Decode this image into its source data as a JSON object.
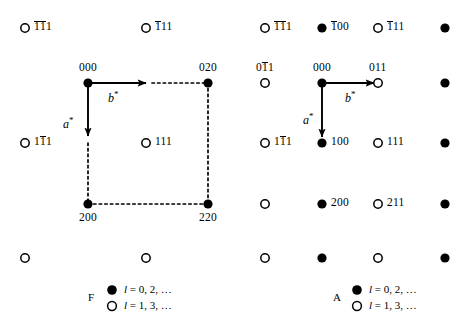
{
  "figure": {
    "type": "reciprocal-lattice-diagram",
    "geometry": {
      "width": 472,
      "height": 329,
      "row_y": [
        28,
        83,
        143,
        204,
        258
      ],
      "left_cols_x": [
        25,
        88,
        146,
        208
      ],
      "right_cols_x": [
        265,
        322,
        378,
        445
      ],
      "node_radius_filled": 4.6,
      "node_radius_open": 4.2
    }
  },
  "left_panel": {
    "id": "F",
    "cell": {
      "corners": [
        "000",
        "020",
        "220",
        "200"
      ],
      "origin_xy": [
        88,
        83
      ],
      "b_end_xy": [
        208,
        83
      ],
      "a_end_xy": [
        88,
        204
      ],
      "dashed": true
    },
    "vectors": {
      "a_label": "a",
      "a_star": "*",
      "b_label": "b",
      "b_star": "*"
    },
    "nodes": [
      {
        "x": 25,
        "y": 28,
        "fill": "open",
        "label": "1̅1̅1",
        "pos": "right"
      },
      {
        "x": 146,
        "y": 28,
        "fill": "open",
        "label": "1̅11",
        "pos": "right"
      },
      {
        "x": 88,
        "y": 83,
        "fill": "filled",
        "label": "000",
        "pos": "above"
      },
      {
        "x": 208,
        "y": 83,
        "fill": "filled",
        "label": "020",
        "pos": "above"
      },
      {
        "x": 25,
        "y": 143,
        "fill": "open",
        "label": "11̅1",
        "pos": "right"
      },
      {
        "x": 146,
        "y": 143,
        "fill": "open",
        "label": "111",
        "pos": "right"
      },
      {
        "x": 88,
        "y": 204,
        "fill": "filled",
        "label": "200",
        "pos": "below"
      },
      {
        "x": 208,
        "y": 204,
        "fill": "filled",
        "label": "220",
        "pos": "below"
      },
      {
        "x": 25,
        "y": 258,
        "fill": "open",
        "label": "",
        "pos": "none"
      },
      {
        "x": 146,
        "y": 258,
        "fill": "open",
        "label": "",
        "pos": "none"
      }
    ],
    "legend": {
      "panel_label": "F",
      "filled_text": "l = 0, 2, …",
      "open_text": "l = 1, 3, …",
      "filled_var": "l",
      "filled_rest": " = 0, 2, …",
      "open_var": "l",
      "open_rest": " = 1, 3, …"
    }
  },
  "right_panel": {
    "id": "A",
    "vectors": {
      "a_label": "a",
      "a_star": "*",
      "b_label": "b",
      "b_star": "*"
    },
    "origin_xy": [
      322,
      83
    ],
    "b_end_xy": [
      378,
      83
    ],
    "a_end_xy": [
      322,
      143
    ],
    "nodes": [
      {
        "x": 265,
        "y": 28,
        "fill": "open",
        "label": "1̅1̅1",
        "pos": "right"
      },
      {
        "x": 322,
        "y": 28,
        "fill": "filled",
        "label": "1̅00",
        "pos": "right"
      },
      {
        "x": 378,
        "y": 28,
        "fill": "open",
        "label": "1̅11",
        "pos": "right"
      },
      {
        "x": 445,
        "y": 28,
        "fill": "filled",
        "label": "",
        "pos": "none"
      },
      {
        "x": 265,
        "y": 83,
        "fill": "open",
        "label": "01̅1",
        "pos": "above"
      },
      {
        "x": 322,
        "y": 83,
        "fill": "filled",
        "label": "000",
        "pos": "above"
      },
      {
        "x": 378,
        "y": 83,
        "fill": "open",
        "label": "011",
        "pos": "above"
      },
      {
        "x": 445,
        "y": 83,
        "fill": "filled",
        "label": "",
        "pos": "none"
      },
      {
        "x": 265,
        "y": 143,
        "fill": "open",
        "label": "11̅1",
        "pos": "right"
      },
      {
        "x": 322,
        "y": 143,
        "fill": "filled",
        "label": "100",
        "pos": "right"
      },
      {
        "x": 378,
        "y": 143,
        "fill": "open",
        "label": "111",
        "pos": "right"
      },
      {
        "x": 445,
        "y": 143,
        "fill": "filled",
        "label": "",
        "pos": "none"
      },
      {
        "x": 265,
        "y": 204,
        "fill": "open",
        "label": "",
        "pos": "none"
      },
      {
        "x": 322,
        "y": 204,
        "fill": "filled",
        "label": "200",
        "pos": "right"
      },
      {
        "x": 378,
        "y": 204,
        "fill": "open",
        "label": "211",
        "pos": "right"
      },
      {
        "x": 445,
        "y": 204,
        "fill": "filled",
        "label": "",
        "pos": "none"
      },
      {
        "x": 265,
        "y": 258,
        "fill": "open",
        "label": "",
        "pos": "none"
      },
      {
        "x": 322,
        "y": 258,
        "fill": "filled",
        "label": "",
        "pos": "none"
      },
      {
        "x": 378,
        "y": 258,
        "fill": "open",
        "label": "",
        "pos": "none"
      },
      {
        "x": 445,
        "y": 258,
        "fill": "filled",
        "label": "",
        "pos": "none"
      }
    ],
    "legend": {
      "panel_label": "A",
      "filled_var": "l",
      "filled_rest": " = 0, 2, …",
      "open_var": "l",
      "open_rest": " = 1, 3, …"
    }
  },
  "colors": {
    "ink": "#000000",
    "background": "#ffffff"
  }
}
